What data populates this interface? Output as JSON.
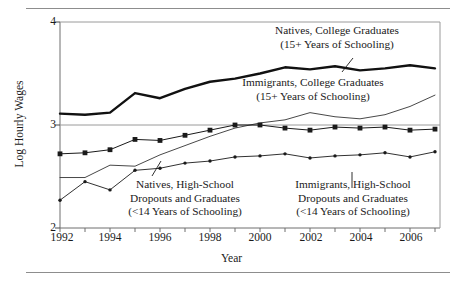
{
  "figure": {
    "name": "log-hourly-wages-by-nativity-and-education",
    "top_rule": true,
    "bottom_rule": true
  },
  "chart_data": {
    "type": "line",
    "title": "",
    "xlabel": "Year",
    "ylabel": "Log Hourly Wages",
    "xlim": [
      1992,
      2007
    ],
    "ylim": [
      2,
      4
    ],
    "yticks": [
      2,
      3,
      4
    ],
    "ytick_labels": [
      "2",
      "3",
      "4"
    ],
    "xticks": [
      1992,
      1993,
      1994,
      1995,
      1996,
      1997,
      1998,
      1999,
      2000,
      2001,
      2002,
      2003,
      2004,
      2005,
      2006,
      2007
    ],
    "xtick_labels_shown": [
      "1992",
      "1994",
      "1996",
      "1998",
      "2000",
      "2002",
      "2004",
      "2006"
    ],
    "grid": "horizontal-at-3-and-4",
    "legend": "inline-annotations",
    "x": [
      1992,
      1993,
      1994,
      1995,
      1996,
      1997,
      1998,
      1999,
      2000,
      2001,
      2002,
      2003,
      2004,
      2005,
      2006,
      2007
    ],
    "series": [
      {
        "name": "Natives, College Graduates (15+ Years of Schooling)",
        "style": "thick-line-no-markers",
        "color": "#111111",
        "width": 2.4,
        "values": [
          3.11,
          3.1,
          3.12,
          3.31,
          3.26,
          3.35,
          3.42,
          3.45,
          3.5,
          3.56,
          3.54,
          3.57,
          3.53,
          3.55,
          3.58,
          3.55
        ]
      },
      {
        "name": "Immigrants, College Graduates (15+ Years of Schooling)",
        "style": "thin-line-no-markers",
        "color": "#333333",
        "width": 0.9,
        "values": [
          2.49,
          2.49,
          2.61,
          2.6,
          2.71,
          2.8,
          2.89,
          2.97,
          3.02,
          3.05,
          3.12,
          3.08,
          3.06,
          3.1,
          3.18,
          3.29
        ]
      },
      {
        "name": "Natives, High-School Dropouts and Graduates (<14 Years of Schooling)",
        "style": "thin-line-square-markers",
        "color": "#1a1a1a",
        "width": 1.0,
        "marker": "square",
        "values": [
          2.72,
          2.73,
          2.76,
          2.86,
          2.85,
          2.9,
          2.95,
          3.0,
          3.0,
          2.97,
          2.95,
          2.98,
          2.97,
          2.98,
          2.95,
          2.96
        ]
      },
      {
        "name": "Immigrants, High-School Dropouts and Graduates (<14 Years of Schooling)",
        "style": "thin-line-dot-markers",
        "color": "#1a1a1a",
        "width": 0.9,
        "marker": "dot",
        "values": [
          2.27,
          2.45,
          2.37,
          2.56,
          2.58,
          2.63,
          2.65,
          2.69,
          2.7,
          2.72,
          2.68,
          2.7,
          2.71,
          2.73,
          2.69,
          2.74
        ]
      }
    ],
    "annotations": [
      {
        "id": "annot-natives-college",
        "lines": [
          "Natives, College Graduates",
          "(15+ Years of Schooling)"
        ],
        "leader": true
      },
      {
        "id": "annot-immigrants-college",
        "lines": [
          "Immigrants, College Graduates",
          "(15+ Years of Schooling)"
        ],
        "leader": false
      },
      {
        "id": "annot-natives-hs",
        "lines": [
          "Natives, High-School",
          "Dropouts and Graduates",
          "(<14 Years of Schooling)"
        ],
        "leader": true
      },
      {
        "id": "annot-immigrants-hs",
        "lines": [
          "Immigrants, High-School",
          "Dropouts and Graduates",
          "(<14 Years of Schooling)"
        ],
        "leader": true
      }
    ]
  },
  "axis": {
    "ytick_2": "2",
    "ytick_3": "3",
    "ytick_4": "4",
    "xtick_1992": "1992",
    "xtick_1994": "1994",
    "xtick_1996": "1996",
    "xtick_1998": "1998",
    "xtick_2000": "2000",
    "xtick_2002": "2002",
    "xtick_2004": "2004",
    "xtick_2006": "2006",
    "xlabel": "Year",
    "ylabel": "Log Hourly Wages"
  },
  "annotations_text": {
    "natives_college_l1": "Natives, College Graduates",
    "natives_college_l2": "(15+ Years of Schooling)",
    "immigrants_college_l1": "Immigrants, College Graduates",
    "immigrants_college_l2": "(15+ Years of Schooling)",
    "natives_hs_l1": "Natives, High-School",
    "natives_hs_l2": "Dropouts and Graduates",
    "natives_hs_l3": "(<14 Years of Schooling)",
    "immigrants_hs_l1": "Immigrants, High-School",
    "immigrants_hs_l2": "Dropouts and Graduates",
    "immigrants_hs_l3": "(<14 Years of Schooling)"
  }
}
